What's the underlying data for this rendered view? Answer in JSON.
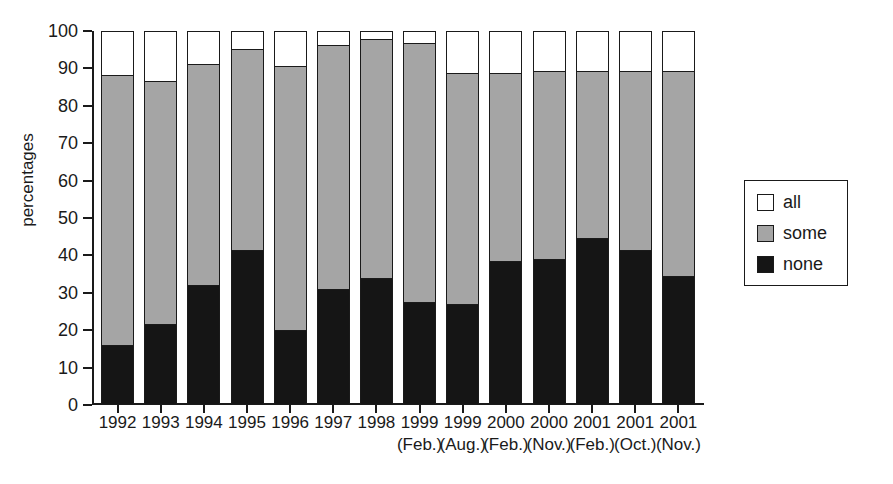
{
  "chart_data": {
    "type": "bar",
    "subtype": "stacked-bar-100",
    "title": "",
    "xlabel": "",
    "ylabel": "percentages",
    "ylim": [
      0,
      100
    ],
    "yticks": [
      0,
      10,
      20,
      30,
      40,
      50,
      60,
      70,
      80,
      90,
      100
    ],
    "grid": false,
    "legend_position": "right",
    "categories": [
      "1992",
      "1993",
      "1994",
      "1995",
      "1996",
      "1997",
      "1998",
      "1999",
      "1999",
      "2000",
      "2000",
      "2001",
      "2001",
      "2001"
    ],
    "category_sublabels": [
      "",
      "",
      "",
      "",
      "",
      "",
      "",
      "(Feb.)",
      "(Aug.)",
      "(Feb.)",
      "(Nov.)",
      "(Feb.)",
      "(Oct.)",
      "(Nov.)"
    ],
    "series": [
      {
        "name": "none",
        "color": "#151515",
        "values": [
          15.5,
          21,
          31.5,
          41,
          19.5,
          30.5,
          33.5,
          27,
          26.5,
          38,
          38.5,
          44,
          41,
          34
        ]
      },
      {
        "name": "some",
        "color": "#a5a5a5",
        "values": [
          72.5,
          65.5,
          59.5,
          54,
          71,
          65.5,
          64,
          69.5,
          62,
          50.5,
          50.5,
          45,
          48,
          55
        ]
      },
      {
        "name": "all",
        "color": "#ffffff",
        "values": [
          12,
          13.5,
          9,
          5,
          9.5,
          4,
          2.5,
          3.5,
          11.5,
          11.5,
          11,
          11,
          11,
          11
        ]
      }
    ],
    "cumulative_tops": {
      "none": [
        15.5,
        21,
        31.5,
        41,
        19.5,
        30.5,
        33.5,
        27,
        26.5,
        38,
        38.5,
        44,
        41,
        34
      ],
      "some": [
        88,
        86.5,
        91,
        95,
        90.5,
        96,
        97.5,
        96.5,
        88.5,
        88.5,
        89,
        89,
        89,
        89
      ],
      "all": [
        100,
        100,
        100,
        100,
        100,
        100,
        100,
        100,
        100,
        100,
        100,
        100,
        100,
        100
      ]
    }
  },
  "legend": {
    "items": [
      {
        "label": "all",
        "swatch": "white-swatch"
      },
      {
        "label": "some",
        "swatch": "gray-swatch"
      },
      {
        "label": "none",
        "swatch": "black-swatch"
      }
    ]
  },
  "axis": {
    "y_title": "percentages"
  }
}
